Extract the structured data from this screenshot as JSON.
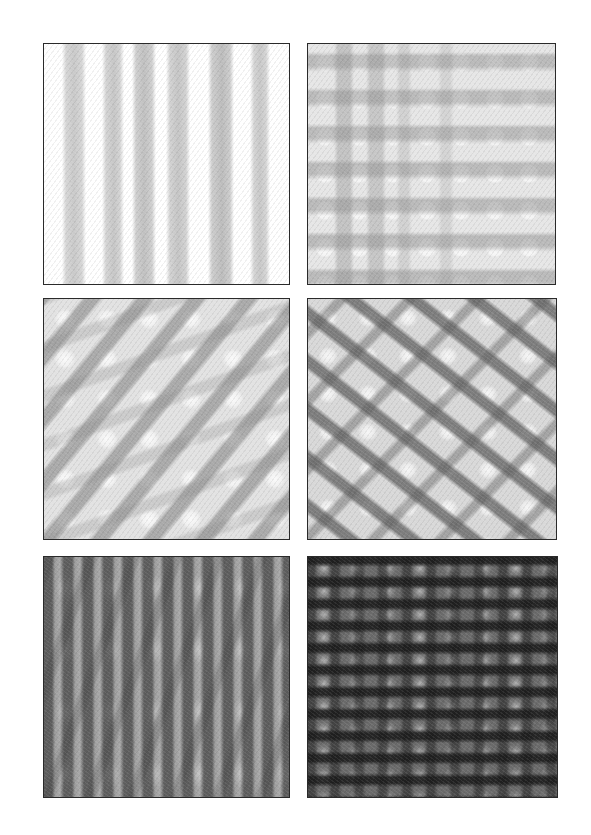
{
  "figure": {
    "layout": {
      "rows": 3,
      "cols": 2
    },
    "panels": [
      {
        "index": 1,
        "pattern": "sparse-vertical-bands",
        "tone": "very-light",
        "color": "#c9c9c9"
      },
      {
        "index": 2,
        "pattern": "horizontal-bands-with-vertical-crossings",
        "tone": "light",
        "color": "#b4b4b4"
      },
      {
        "index": 3,
        "pattern": "diagonal-bands-up-right",
        "tone": "light-medium",
        "color": "#9a9a9a"
      },
      {
        "index": 4,
        "pattern": "diagonal-crosshatch",
        "tone": "medium",
        "color": "#6e6e6e"
      },
      {
        "index": 5,
        "pattern": "dense-vertical-and-steep-diagonal",
        "tone": "medium-dark",
        "color": "#555555"
      },
      {
        "index": 6,
        "pattern": "dense-horizontal-vertical-grid",
        "tone": "dark",
        "color": "#2a2a2a"
      }
    ],
    "border_color": "#2a2a2a",
    "background_color": "#ffffff"
  }
}
